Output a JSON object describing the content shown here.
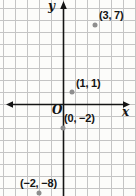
{
  "chart_data": {
    "type": "scatter",
    "title": "",
    "points": [
      {
        "x": 3,
        "y": 7,
        "label": "(3, 7)"
      },
      {
        "x": 1,
        "y": 1,
        "label": "(1, 1)"
      },
      {
        "x": 0,
        "y": -2,
        "label": "(0, −2)"
      },
      {
        "x": -2,
        "y": -8,
        "label": "(−2, −8)"
      }
    ],
    "x_axis_label": "x",
    "y_axis_label": "y",
    "origin_label": "O",
    "grid": true,
    "x_range": [
      -5,
      6
    ],
    "y_range": [
      -8,
      8
    ],
    "colors": {
      "background": "#fcfcfa",
      "grid": "#c4c4c4",
      "axis": "#141414",
      "dot": "#8e8e8e",
      "text": "#141414"
    }
  }
}
